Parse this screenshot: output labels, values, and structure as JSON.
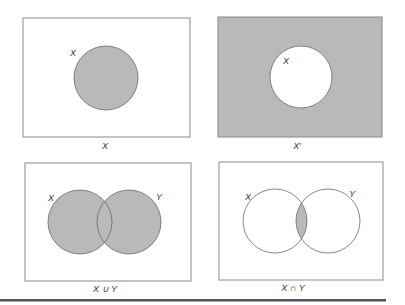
{
  "colors": {
    "shade": "#b9b9b9",
    "stroke": "#6a6a6a",
    "box_stroke": "#8a8a8a",
    "rule": "#555555"
  },
  "panels": [
    {
      "id": "complement-base",
      "caption": "X",
      "set_labels": [
        "X"
      ],
      "description": "Set X shaded inside universal rectangle"
    },
    {
      "id": "complement",
      "caption": "X′",
      "set_labels": [
        "X"
      ],
      "description": "Complement of X shaded"
    },
    {
      "id": "union",
      "caption": "X ∪ Y",
      "set_labels": [
        "X",
        "Y"
      ],
      "description": "Union of X and Y shaded"
    },
    {
      "id": "intersection",
      "caption": "X ∩ Y",
      "set_labels": [
        "X",
        "Y"
      ],
      "description": "Intersection of X and Y shaded"
    }
  ]
}
